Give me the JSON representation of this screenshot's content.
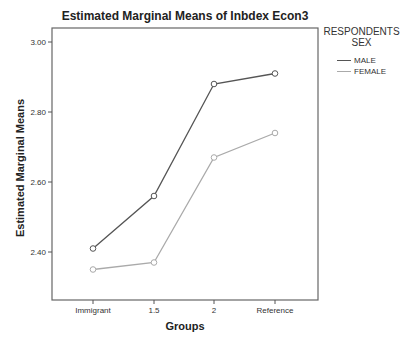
{
  "chart_data": {
    "type": "line",
    "title": "Estimated Marginal Means of Inbdex Econ3",
    "xlabel": "Groups",
    "ylabel": "Estimated Marginal Means",
    "categories": [
      "Immigrant",
      "1.5",
      "2",
      "Reference"
    ],
    "series": [
      {
        "name": "MALE",
        "values": [
          2.41,
          2.56,
          2.88,
          2.91
        ],
        "color": "#555555"
      },
      {
        "name": "FEMALE",
        "values": [
          2.35,
          2.37,
          2.67,
          2.74
        ],
        "color": "#aaaaaa"
      }
    ],
    "yticks": [
      "2.40",
      "2.60",
      "2.80",
      "3.00"
    ],
    "ylim": [
      2.27,
      3.04
    ],
    "legend_title": "RESPONDENTS SEX",
    "legend_position": "right",
    "grid": false
  },
  "legend": {
    "title_line1": "RESPONDENTS",
    "title_line2": "SEX",
    "items": [
      {
        "label": "MALE",
        "color": "#555555"
      },
      {
        "label": "FEMALE",
        "color": "#aaaaaa"
      }
    ]
  }
}
